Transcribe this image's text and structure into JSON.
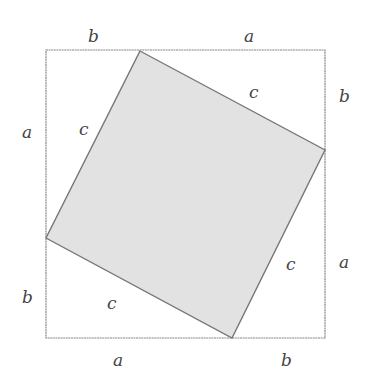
{
  "diagram": {
    "colors": {
      "background": "#ffffff",
      "outer_stroke": "#888888",
      "inner_fill": "#e2e2e2",
      "inner_stroke": "#777777",
      "label": "#444444"
    },
    "outer_square": {
      "x": 46,
      "y": 50,
      "size": 279
    },
    "inner_square_points": "140,51 325,150 232,338 46,238",
    "labels": [
      {
        "id": "top-b",
        "text": "b",
        "x": 88,
        "y": 42
      },
      {
        "id": "top-a",
        "text": "a",
        "x": 244,
        "y": 42
      },
      {
        "id": "right-b",
        "text": "b",
        "x": 339,
        "y": 102
      },
      {
        "id": "right-a",
        "text": "a",
        "x": 339,
        "y": 268
      },
      {
        "id": "bottom-a",
        "text": "a",
        "x": 113,
        "y": 366
      },
      {
        "id": "bottom-b",
        "text": "b",
        "x": 281,
        "y": 366
      },
      {
        "id": "left-a",
        "text": "a",
        "x": 22,
        "y": 138
      },
      {
        "id": "left-b",
        "text": "b",
        "x": 22,
        "y": 303
      },
      {
        "id": "inner-c-topright",
        "text": "c",
        "x": 249,
        "y": 98
      },
      {
        "id": "inner-c-topleft",
        "text": "c",
        "x": 79,
        "y": 135
      },
      {
        "id": "inner-c-right",
        "text": "c",
        "x": 286,
        "y": 270
      },
      {
        "id": "inner-c-bottom",
        "text": "c",
        "x": 107,
        "y": 309
      }
    ]
  }
}
